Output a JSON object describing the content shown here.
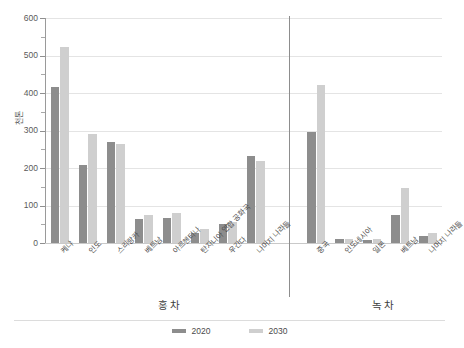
{
  "chart_data": {
    "type": "bar",
    "title": "",
    "subtitle": "",
    "xlabel": "",
    "ylabel": "천톤",
    "ylim": [
      0,
      600
    ],
    "yticks": [
      0,
      100,
      200,
      300,
      400,
      500,
      600
    ],
    "ytick_labels": [
      "0",
      "100",
      "200",
      "300",
      "400",
      "500",
      "600"
    ],
    "minor_tick_step": 50,
    "grid": true,
    "grid_axis": "y",
    "legend_position": "bottom-center",
    "panel_divider": true,
    "panels": [
      {
        "label": "홍차",
        "categories": [
          "케냐",
          "인도",
          "스리랑카",
          "베트남",
          "아르헨티나",
          "탄자니아 연합 공화국",
          "우간다",
          "나머지 나라들"
        ],
        "series": [
          {
            "name": "2020",
            "color": "#8d8d8d",
            "values": [
              415,
              207,
              270,
              65,
              68,
              28,
              50,
              233
            ]
          },
          {
            "name": "2030",
            "color": "#cfcfcf",
            "values": [
              522,
              290,
              263,
              75,
              80,
              38,
              57,
              220
            ]
          }
        ]
      },
      {
        "label": "녹차",
        "categories": [
          "중국",
          "인도네시아",
          "일본",
          "베트남",
          "나머지 나라들"
        ],
        "series": [
          {
            "name": "2020",
            "color": "#8d8d8d",
            "values": [
              295,
              10,
              8,
              75,
              20
            ]
          },
          {
            "name": "2030",
            "color": "#cfcfcf",
            "values": [
              422,
              12,
              10,
              147,
              28
            ]
          }
        ]
      }
    ],
    "legend": [
      {
        "label": "2020",
        "color": "#8d8d8d"
      },
      {
        "label": "2030",
        "color": "#cfcfcf"
      }
    ]
  }
}
